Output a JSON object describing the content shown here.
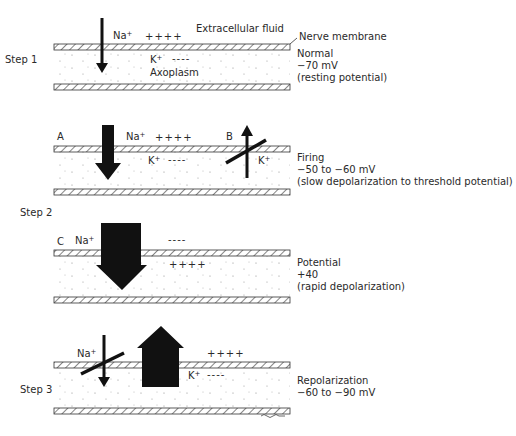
{
  "diagram": {
    "labels": {
      "extracellular": "Extracellular fluid",
      "nerve_membrane": "Nerve membrane",
      "axoplasm": "Axoplasm",
      "signature": "sac"
    },
    "steps": [
      {
        "step_label": "Step 1",
        "panel_letter": "",
        "ions": {
          "na": "Na",
          "na_sup": "+",
          "k": "K",
          "k_sup": "+",
          "outside_charge": "++++",
          "inside_charge": "----"
        },
        "state": {
          "name": "Normal",
          "value": "−70 mV",
          "note": "(resting potential)"
        }
      },
      {
        "step_label": "",
        "panel_letter": "A",
        "panel_letter_b": "B",
        "ions": {
          "na": "Na",
          "na_sup": "+",
          "k": "K",
          "k_sup": "+",
          "k2": "K",
          "k2_sup": "+",
          "outside_charge": "++++",
          "inside_charge": "----"
        },
        "state": {
          "name": "Firing",
          "value": "−50 to −60 mV",
          "note": "(slow depolarization to threshold potential)"
        }
      },
      {
        "step_label": "Step 2",
        "panel_letter": "C",
        "ions": {
          "na": "Na",
          "na_sup": "+",
          "outside_charge": "----",
          "inside_charge": "++++"
        },
        "state": {
          "name": "Potential",
          "value": "+40",
          "note": "(rapid depolarization)"
        }
      },
      {
        "step_label": "Step 3",
        "panel_letter": "",
        "ions": {
          "na": "Na",
          "na_sup": "+",
          "k": "K",
          "k_sup": "+",
          "outside_charge": "++++",
          "inside_charge": "----"
        },
        "state": {
          "name": "Repolarization",
          "value": "−60 to −90 mV",
          "note": ""
        }
      }
    ],
    "colors": {
      "ink": "#111111",
      "text": "#2a2a2a",
      "hatch": "#333333",
      "background": "#ffffff"
    }
  }
}
